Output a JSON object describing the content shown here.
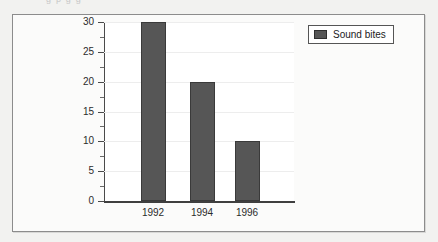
{
  "scan": {
    "top_artifact_text": "g  p        g        g"
  },
  "legend": {
    "label": "Sound bites",
    "swatch_color": "#565656"
  },
  "chart_data": {
    "type": "bar",
    "title": "",
    "subtitle": "",
    "xlabel": "",
    "ylabel": "",
    "categories": [
      "1992",
      "1994",
      "1996"
    ],
    "values": [
      30,
      20,
      10
    ],
    "series": [
      {
        "name": "Sound bites",
        "values": [
          30,
          20,
          10
        ],
        "color": "#565656"
      }
    ],
    "ylim": [
      0,
      30
    ],
    "y_major_ticks": [
      0,
      5,
      10,
      15,
      20,
      25,
      30
    ],
    "y_minor_ticks": [
      2.5,
      7.5,
      12.5,
      17.5,
      22.5,
      27.5
    ],
    "y_tick_labels": [
      "0",
      "5",
      "10",
      "15",
      "20",
      "25",
      "30"
    ],
    "x_tick_labels": [
      "1992",
      "1994",
      "1996"
    ],
    "grid": true,
    "legend_position": "top-right",
    "plot_background": "#ffffff",
    "frame_background": "#fbfbfa",
    "page_background": "#f2f2f0",
    "axis_color": "#4a4a4a"
  }
}
